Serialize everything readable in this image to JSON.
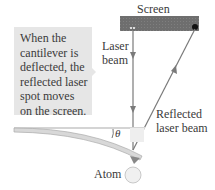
{
  "diagram": {
    "callout": {
      "lines": [
        "When the",
        "cantilever is",
        "deflected, the",
        "reflected laser",
        "spot moves",
        "on the screen."
      ]
    },
    "labels": {
      "screen": "Screen",
      "laser_beam_line1": "Laser",
      "laser_beam_line2": "beam",
      "reflected_line1": "Reflected",
      "reflected_line2": "laser beam",
      "angle": "θ",
      "atom": "Atom"
    },
    "colors": {
      "screen": "#6e6e6e",
      "beam": "#7a7a7a",
      "callout_bg": "#e6e6e6",
      "cantilever": "#d8d8d8",
      "atom": "#f0f0f0"
    }
  }
}
